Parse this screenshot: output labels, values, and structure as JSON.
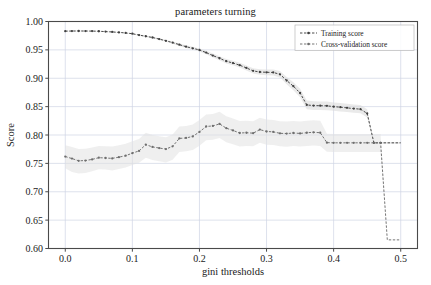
{
  "chart_data": {
    "type": "line",
    "title": "parameters turning",
    "xlabel": "gini thresholds",
    "ylabel": "Score",
    "xlim": [
      -0.025,
      0.525
    ],
    "ylim": [
      0.6,
      1.0
    ],
    "xticks": [
      "0.0",
      "0.1",
      "0.2",
      "0.3",
      "0.4",
      "0.5"
    ],
    "xtick_values": [
      0.0,
      0.1,
      0.2,
      0.3,
      0.4,
      0.5
    ],
    "yticks": [
      "0.60",
      "0.65",
      "0.70",
      "0.75",
      "0.80",
      "0.85",
      "0.90",
      "0.95",
      "1.00"
    ],
    "ytick_values": [
      0.6,
      0.65,
      0.7,
      0.75,
      0.8,
      0.85,
      0.9,
      0.95,
      1.0
    ],
    "grid": true,
    "legend_position": "upper right",
    "legend": [
      "Training score",
      "Cross-validation score"
    ],
    "colors": {
      "training_line": "#3f3f3f",
      "cross_validation_line": "#6e6e6e",
      "training_band": "#d9d9d9",
      "cross_validation_band": "#e2e2e2",
      "grid": "#cfd4e4",
      "axis": "#4a4a4a",
      "text": "#1a1a1a",
      "background": "#ffffff"
    },
    "x": [
      0.0,
      0.01,
      0.02,
      0.03,
      0.04,
      0.05,
      0.06,
      0.07,
      0.08,
      0.09,
      0.1,
      0.11,
      0.12,
      0.13,
      0.14,
      0.15,
      0.16,
      0.17,
      0.18,
      0.19,
      0.2,
      0.21,
      0.22,
      0.23,
      0.24,
      0.25,
      0.26,
      0.27,
      0.28,
      0.29,
      0.3,
      0.31,
      0.32,
      0.33,
      0.34,
      0.35,
      0.36,
      0.37,
      0.38,
      0.39,
      0.4,
      0.41,
      0.42,
      0.43,
      0.44,
      0.45,
      0.46,
      0.47,
      0.48,
      0.49,
      0.5
    ],
    "series": [
      {
        "name": "Training score",
        "style": "dashed-with-dot-markers",
        "values": [
          0.983,
          0.9832,
          0.9833,
          0.9832,
          0.9831,
          0.9828,
          0.9822,
          0.9816,
          0.9808,
          0.9798,
          0.9785,
          0.976,
          0.974,
          0.9718,
          0.969,
          0.966,
          0.9628,
          0.9592,
          0.9556,
          0.9528,
          0.9498,
          0.9452,
          0.94,
          0.9352,
          0.93,
          0.9268,
          0.923,
          0.9182,
          0.913,
          0.911,
          0.9105,
          0.9102,
          0.907,
          0.896,
          0.886,
          0.874,
          0.853,
          0.8518,
          0.8516,
          0.8514,
          0.85,
          0.849,
          0.8478,
          0.8465,
          0.8455,
          0.838,
          0.7862,
          0.7862,
          0.7862,
          0.7862,
          0.7862
        ],
        "band_lower": [
          0.9822,
          0.9824,
          0.9825,
          0.9824,
          0.9823,
          0.982,
          0.9814,
          0.9808,
          0.98,
          0.9789,
          0.9775,
          0.9748,
          0.9727,
          0.9704,
          0.9674,
          0.9642,
          0.9608,
          0.957,
          0.9532,
          0.9502,
          0.947,
          0.9421,
          0.9366,
          0.9316,
          0.9262,
          0.9228,
          0.9188,
          0.9138,
          0.9084,
          0.9062,
          0.9054,
          0.9048,
          0.9012,
          0.8896,
          0.879,
          0.8664,
          0.8452,
          0.8442,
          0.844,
          0.8438,
          0.8426,
          0.8416,
          0.8404,
          0.8392,
          0.8382,
          0.8308,
          0.7846,
          0.7846,
          0.7846,
          0.7846,
          0.7846
        ],
        "band_upper": [
          0.9838,
          0.984,
          0.9841,
          0.984,
          0.9839,
          0.9836,
          0.983,
          0.9824,
          0.9816,
          0.9807,
          0.9795,
          0.9772,
          0.9753,
          0.9732,
          0.9706,
          0.9678,
          0.9648,
          0.9614,
          0.958,
          0.9554,
          0.9526,
          0.9483,
          0.9434,
          0.9388,
          0.9338,
          0.9308,
          0.9272,
          0.9226,
          0.9176,
          0.9158,
          0.9156,
          0.9156,
          0.9128,
          0.9024,
          0.893,
          0.8816,
          0.8608,
          0.8594,
          0.8592,
          0.859,
          0.8574,
          0.8564,
          0.8552,
          0.8538,
          0.8528,
          0.8452,
          0.7878,
          0.7878,
          0.7878,
          0.7878,
          0.7878
        ]
      },
      {
        "name": "Cross-validation score",
        "style": "dashed-with-dot-markers",
        "values": [
          0.762,
          0.7585,
          0.7545,
          0.755,
          0.757,
          0.76,
          0.7595,
          0.7588,
          0.761,
          0.7635,
          0.768,
          0.772,
          0.783,
          0.779,
          0.777,
          0.7752,
          0.78,
          0.794,
          0.7948,
          0.7975,
          0.8055,
          0.815,
          0.816,
          0.8195,
          0.812,
          0.808,
          0.8035,
          0.804,
          0.8032,
          0.8095,
          0.8062,
          0.8055,
          0.803,
          0.8025,
          0.8035,
          0.8028,
          0.804,
          0.8048,
          0.804,
          0.7865,
          0.7862,
          0.7862,
          0.7862,
          0.7862,
          0.7862,
          0.7862,
          0.7862,
          0.7862,
          0.6152,
          0.6152,
          0.6152
        ],
        "band_lower": [
          0.7415,
          0.735,
          0.732,
          0.7332,
          0.7362,
          0.7396,
          0.739,
          0.7376,
          0.74,
          0.7426,
          0.747,
          0.7512,
          0.76,
          0.756,
          0.7536,
          0.7516,
          0.7562,
          0.77,
          0.7712,
          0.7736,
          0.7812,
          0.7906,
          0.7916,
          0.7946,
          0.7874,
          0.7838,
          0.7798,
          0.7806,
          0.78,
          0.7862,
          0.783,
          0.7822,
          0.78,
          0.7795,
          0.7804,
          0.7798,
          0.7808,
          0.7816,
          0.7806,
          0.7706,
          0.77,
          0.77,
          0.77,
          0.77,
          0.77,
          0.77,
          0.77,
          0.77,
          0.6152,
          0.6152,
          0.6152
        ],
        "band_upper": [
          0.782,
          0.7788,
          0.7752,
          0.7758,
          0.778,
          0.7808,
          0.7802,
          0.7796,
          0.782,
          0.7846,
          0.789,
          0.793,
          0.804,
          0.8,
          0.798,
          0.7962,
          0.801,
          0.815,
          0.8158,
          0.8186,
          0.8266,
          0.8362,
          0.8372,
          0.8408,
          0.8332,
          0.8292,
          0.8246,
          0.8252,
          0.8244,
          0.8306,
          0.8274,
          0.8266,
          0.8242,
          0.8236,
          0.8246,
          0.8238,
          0.825,
          0.8258,
          0.825,
          0.802,
          0.8018,
          0.8018,
          0.8018,
          0.8018,
          0.8018,
          0.8018,
          0.8018,
          0.8018,
          0.6152,
          0.6152,
          0.6152
        ]
      }
    ]
  }
}
